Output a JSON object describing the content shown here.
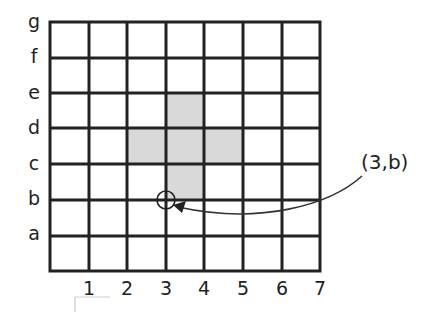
{
  "diagram": {
    "type": "coordinate-grid",
    "columns": [
      "1",
      "2",
      "3",
      "4",
      "5",
      "6",
      "7"
    ],
    "rows": [
      "a",
      "b",
      "c",
      "d",
      "e",
      "f",
      "g"
    ],
    "shaded_cells": [
      {
        "col": 4,
        "row": "d",
        "note": "cell between d and e lines"
      },
      {
        "col": 3,
        "row": "c",
        "note": "cell between c and d lines"
      },
      {
        "col": 4,
        "row": "c"
      },
      {
        "col": 5,
        "row": "c"
      },
      {
        "col": 4,
        "row": "b",
        "note": "cell between b and c lines"
      }
    ],
    "highlighted_point": {
      "x": "3",
      "y": "b"
    },
    "callout_label": "(3,b)",
    "colors": {
      "grid_line": "#222222",
      "shade": "#d9d9d9",
      "text": "#222222"
    }
  }
}
